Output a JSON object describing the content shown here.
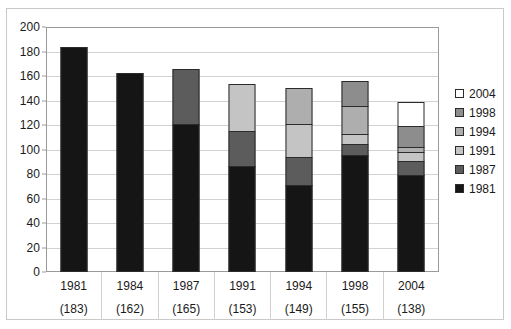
{
  "chart_data": {
    "type": "bar",
    "subtype": "stacked-vertical",
    "title": "",
    "xlabel": "",
    "ylabel": "",
    "ylim": [
      0,
      200
    ],
    "ytick_step": 20,
    "yticks": [
      200,
      180,
      160,
      140,
      120,
      100,
      80,
      60,
      40,
      20,
      0
    ],
    "grid": true,
    "grid_axis": "y",
    "legend_position": "right",
    "categories": [
      "1981",
      "1984",
      "1987",
      "1991",
      "1994",
      "1998",
      "2004"
    ],
    "category_counts": [
      "(183)",
      "(162)",
      "(165)",
      "(153)",
      "(149)",
      "(155)",
      "(138)"
    ],
    "totals": [
      183,
      162,
      165,
      153,
      149,
      155,
      138
    ],
    "series": [
      {
        "name": "1981",
        "color": "#151515",
        "values": [
          183,
          162,
          120,
          86,
          70,
          95,
          78
        ]
      },
      {
        "name": "1987",
        "color": "#5c5c5c",
        "values": [
          0,
          0,
          45,
          28,
          23,
          9,
          12
        ]
      },
      {
        "name": "1991",
        "color": "#c4c4c4",
        "values": [
          0,
          0,
          0,
          39,
          27,
          8,
          7
        ]
      },
      {
        "name": "1994",
        "color": "#aeaeae",
        "values": [
          0,
          0,
          0,
          0,
          29,
          23,
          4
        ]
      },
      {
        "name": "1998",
        "color": "#8d8d8d",
        "values": [
          0,
          0,
          0,
          0,
          0,
          20,
          17
        ]
      },
      {
        "name": "2004",
        "color": "#ffffff",
        "values": [
          0,
          0,
          0,
          0,
          0,
          0,
          20
        ]
      }
    ]
  },
  "legend": {
    "items": [
      {
        "label": "2004",
        "color": "#ffffff"
      },
      {
        "label": "1998",
        "color": "#8d8d8d"
      },
      {
        "label": "1994",
        "color": "#aeaeae"
      },
      {
        "label": "1991",
        "color": "#c4c4c4"
      },
      {
        "label": "1987",
        "color": "#5c5c5c"
      },
      {
        "label": "1981",
        "color": "#151515"
      }
    ]
  },
  "colors": {
    "plot_border": "#9a9a9a",
    "grid": "#d2d2d2",
    "frame": "#c9c9c9",
    "text": "#1a1a1a",
    "segment_outline": "#2b2b2b"
  }
}
